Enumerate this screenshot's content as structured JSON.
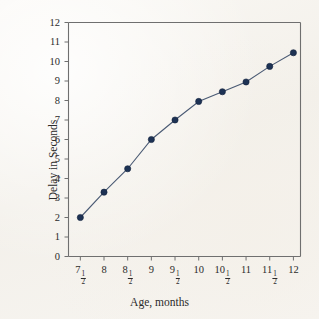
{
  "chart_data": {
    "type": "line",
    "title": "",
    "xlabel": "Age, months",
    "ylabel": "Delay in Seconds",
    "x": [
      7.5,
      8,
      8.5,
      9,
      9.5,
      10,
      10.5,
      11,
      11.5,
      12
    ],
    "values": [
      2.0,
      3.3,
      4.5,
      6.0,
      7.0,
      7.95,
      8.45,
      8.95,
      9.75,
      10.45
    ],
    "xtick_labels": [
      "7½",
      "8",
      "8½",
      "9",
      "9½",
      "10",
      "10½",
      "11",
      "11½",
      "12"
    ],
    "xtick_parts": [
      {
        "whole": "7",
        "num": "1",
        "den": "2"
      },
      {
        "whole": "8",
        "num": "",
        "den": ""
      },
      {
        "whole": "8",
        "num": "1",
        "den": "2"
      },
      {
        "whole": "9",
        "num": "",
        "den": ""
      },
      {
        "whole": "9",
        "num": "1",
        "den": "2"
      },
      {
        "whole": "10",
        "num": "",
        "den": ""
      },
      {
        "whole": "10",
        "num": "1",
        "den": "2"
      },
      {
        "whole": "11",
        "num": "",
        "den": ""
      },
      {
        "whole": "11",
        "num": "1",
        "den": "2"
      },
      {
        "whole": "12",
        "num": "",
        "den": ""
      }
    ],
    "ytick_labels": [
      "0",
      "1",
      "2",
      "3",
      "4",
      "5",
      "6",
      "7",
      "8",
      "9",
      "10",
      "11",
      "12"
    ],
    "ytick_values": [
      0,
      1,
      2,
      3,
      4,
      5,
      6,
      7,
      8,
      9,
      10,
      11,
      12
    ],
    "xlim": [
      7.25,
      12.15
    ],
    "ylim": [
      0,
      12
    ],
    "grid": false,
    "legend": null,
    "marker": "filled-circle",
    "colors": {
      "line": "#4a5a74",
      "marker": "#1d3254",
      "axis": "#6f6f6f",
      "text": "#2b2b2b",
      "background": "#f6f4f0"
    }
  }
}
